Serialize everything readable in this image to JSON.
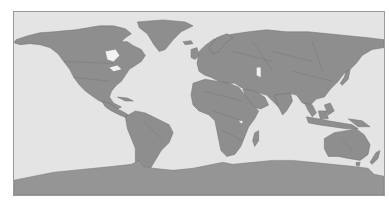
{
  "map": {
    "projection": "equirectangular",
    "style": "grayscale political boundaries",
    "colors": {
      "ocean": "#e4e4e4",
      "land": "#8e8e8e",
      "land_border": "#6f6f6f",
      "antarctica": "#959595",
      "lakes": "#f2f2f2",
      "frame": "#9a9a9a"
    },
    "regions": [
      "North America",
      "Greenland",
      "South America",
      "Europe",
      "Africa",
      "Asia",
      "Australia",
      "New Zealand",
      "Antarctica",
      "Madagascar",
      "Japan",
      "Indonesia",
      "British Isles"
    ]
  }
}
